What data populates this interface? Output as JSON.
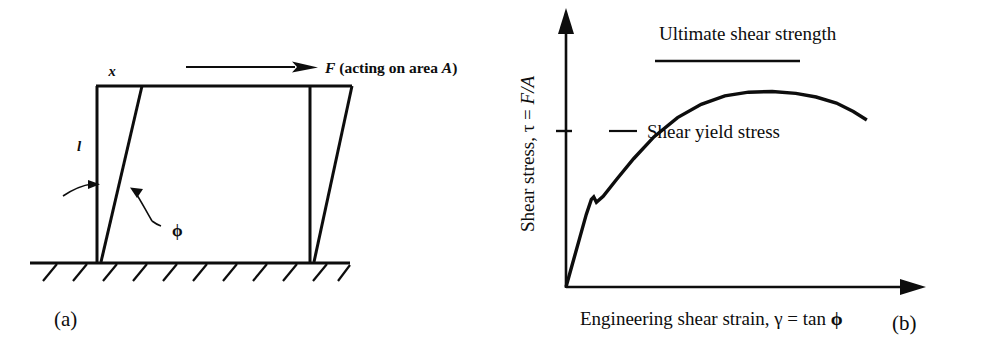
{
  "figure": {
    "ink_color": "#0d0d0d",
    "background_color": "#ffffff"
  },
  "panel_a": {
    "caption": "(a)",
    "labels": {
      "displacement": "x",
      "length": "l",
      "angle": "ϕ",
      "force": "F",
      "force_note": " (acting on area ",
      "force_area": "A",
      "force_close": ")"
    },
    "icon_names": {
      "force_arrow": "force-arrow-icon",
      "angle_pointer_left": "angle-pointer-left-icon",
      "angle_pointer_right": "angle-pointer-right-icon",
      "ground": "fixed-ground-hatching-icon"
    }
  },
  "panel_b": {
    "caption": "(b)",
    "annotations": {
      "ultimate": "Ultimate shear strength",
      "yield": "Shear yield stress"
    },
    "axis_labels": {
      "y_prefix": "Shear stress, ",
      "y_symbol": "τ",
      "y_eq": " = ",
      "y_value": "F/A",
      "x_prefix": "Engineering shear strain, ",
      "x_symbol": "γ",
      "x_eq": " = tan ",
      "x_value": "ϕ"
    }
  },
  "chart_data": {
    "type": "line",
    "title": "",
    "xlabel": "Engineering shear strain, γ = tan ϕ",
    "ylabel": "Shear stress, τ = F/A",
    "grid": false,
    "legend": null,
    "xlim": [
      0,
      1
    ],
    "ylim": [
      0,
      1
    ],
    "axis_arrows": true,
    "annotations": [
      {
        "text": "Shear yield stress",
        "kind": "level-marker",
        "y": 0.36,
        "tick_on_y_axis": true,
        "leader_dash": true
      },
      {
        "text": "Ultimate shear strength",
        "kind": "level-marker",
        "y": 0.8,
        "tick_on_y_axis": false,
        "tangent_line": true
      }
    ],
    "series": [
      {
        "name": "shear stress-strain curve",
        "x": [
          0.0,
          0.02,
          0.04,
          0.06,
          0.075,
          0.082,
          0.09,
          0.11,
          0.15,
          0.2,
          0.26,
          0.33,
          0.4,
          0.47,
          0.54,
          0.61,
          0.68,
          0.74,
          0.8,
          0.85,
          0.89
        ],
        "y": [
          0.0,
          0.1,
          0.2,
          0.3,
          0.362,
          0.372,
          0.35,
          0.375,
          0.445,
          0.53,
          0.62,
          0.7,
          0.755,
          0.79,
          0.805,
          0.808,
          0.8,
          0.785,
          0.76,
          0.725,
          0.69
        ]
      }
    ]
  }
}
